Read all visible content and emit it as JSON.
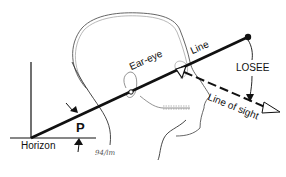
{
  "diagram": {
    "type": "anatomical-head-profile",
    "labels": {
      "horizon": "Horizon",
      "p": "P",
      "ear_eye": "Ear-eye",
      "line": "Line",
      "losee": "LOSEE",
      "line_of_sight": "Line of sight",
      "signature": "94/lm"
    },
    "colors": {
      "ink": "#111111",
      "outline": "#555555",
      "background": "#ffffff"
    }
  }
}
